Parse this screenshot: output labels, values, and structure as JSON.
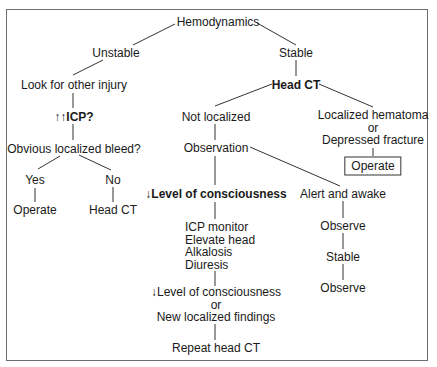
{
  "diagram": {
    "root": "Hemodynamics",
    "unstable_branch": {
      "label": "Unstable",
      "step1": "Look for other injury",
      "step2": "↑↑ICP?",
      "step3": "Obvious localized bleed?",
      "yes": {
        "label": "Yes",
        "action": "Operate"
      },
      "no": {
        "label": "No",
        "action": "Head CT"
      }
    },
    "stable_branch": {
      "label": "Stable",
      "head_ct": "Head CT",
      "not_localized": {
        "label": "Not localized",
        "observation": "Observation",
        "decreased_loc": {
          "label": "↓Level of consciousness",
          "interventions": [
            "ICP monitor",
            "Elevate head",
            "Alkalosis",
            "Diuresis"
          ],
          "reassess": [
            "↓Level of consciousness",
            "or",
            "New localized findings"
          ],
          "final": "Repeat head CT"
        },
        "alert": {
          "label": "Alert and awake",
          "steps": [
            "Observe",
            "Stable",
            "Observe"
          ]
        }
      },
      "localized": {
        "lines": [
          "Localized hematoma",
          "or",
          "Depressed fracture"
        ],
        "action": "Operate"
      }
    }
  }
}
